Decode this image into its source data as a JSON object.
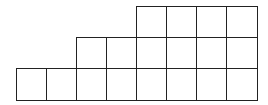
{
  "diagram": {
    "type": "staircase-grid",
    "columns": 8,
    "rows": 3,
    "cell_size": 30,
    "origin": {
      "x": 16,
      "y": 6
    },
    "line_color": "#222222",
    "rows_cells": [
      {
        "row": 1,
        "start_col": 5,
        "end_col": 8,
        "count": 4
      },
      {
        "row": 2,
        "start_col": 3,
        "end_col": 8,
        "count": 6
      },
      {
        "row": 3,
        "start_col": 1,
        "end_col": 8,
        "count": 8
      }
    ],
    "total_cells": 18
  }
}
